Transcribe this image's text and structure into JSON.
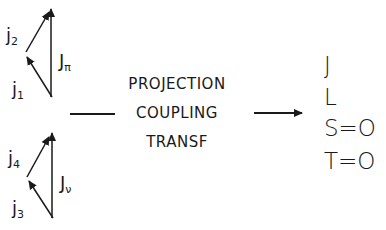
{
  "top_triangle": {
    "j1": {
      "base": "j",
      "sub": "1"
    },
    "j2": {
      "base": "j",
      "sub": "2"
    },
    "total": {
      "base": "J",
      "sub": "π"
    }
  },
  "bottom_triangle": {
    "j3": {
      "base": "j",
      "sub": "3"
    },
    "j4": {
      "base": "j",
      "sub": "4"
    },
    "total": {
      "base": "J",
      "sub": "ν"
    }
  },
  "transformation": {
    "line1": "PROJECTION",
    "line2": "COUPLING",
    "line3": "TRANSF"
  },
  "result": {
    "line1": "J",
    "line2": "L",
    "line3": "S=O",
    "line4": "T=O"
  },
  "colors": {
    "ink": "#1a1a1a",
    "background": "#ffffff"
  }
}
